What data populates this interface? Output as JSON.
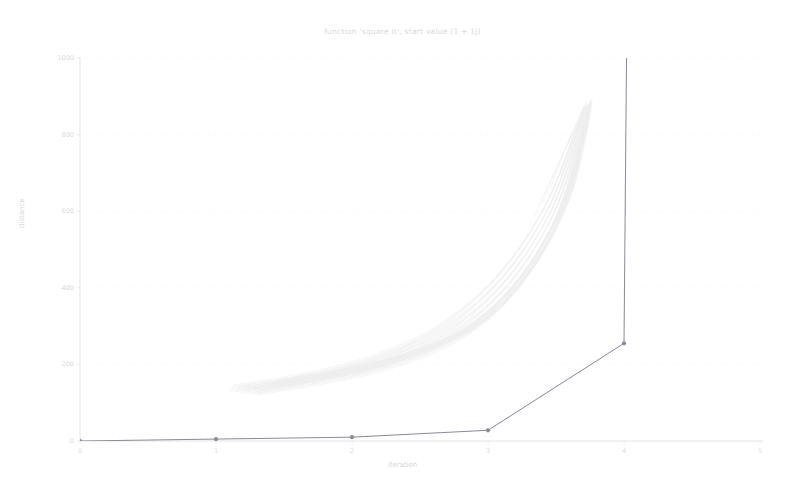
{
  "chart_data": {
    "type": "line",
    "title": "function 'square it', start value (1 + 1j)",
    "xlabel": "iteration",
    "ylabel": "distance",
    "xlim": [
      0,
      5
    ],
    "ylim": [
      0,
      1000
    ],
    "grid": true,
    "grid_style": "dotted",
    "legend": "none",
    "xticks": [
      0,
      1,
      2,
      3,
      4,
      5
    ],
    "xtick_labels": [
      "0",
      "1",
      "2",
      "3",
      "4",
      "5"
    ],
    "yticks": [
      0,
      200,
      400,
      600,
      800,
      1000
    ],
    "ytick_labels": [
      "0",
      "200",
      "400",
      "600",
      "800",
      "1000"
    ],
    "series": [
      {
        "name": "trajectory",
        "color": "#8a8a99",
        "marker": "circle",
        "linewidth": 1,
        "x": [
          0,
          1,
          2,
          3,
          4,
          4.02
        ],
        "values": [
          0,
          5,
          10,
          28,
          255,
          1060
        ]
      },
      {
        "name": "ensemble",
        "color": "#ededed",
        "marker": "none",
        "linewidth": 0.7,
        "description": "faint bundle of exponential-growth curves",
        "curves": [
          {
            "x": [
              1.1,
              1.6,
              2.1,
              2.6,
              3.05,
              3.4,
              3.62,
              3.7
            ],
            "values": [
              130,
              160,
              205,
              285,
              420,
              600,
              790,
              870
            ]
          },
          {
            "x": [
              1.14,
              1.64,
              2.14,
              2.64,
              3.08,
              3.42,
              3.63,
              3.7
            ],
            "values": [
              128,
              158,
              202,
              281,
              414,
              592,
              783,
              868
            ]
          },
          {
            "x": [
              1.18,
              1.68,
              2.18,
              2.68,
              3.11,
              3.44,
              3.64,
              3.71
            ],
            "values": [
              126,
              156,
              199,
              277,
              408,
              585,
              776,
              866
            ]
          },
          {
            "x": [
              1.22,
              1.72,
              2.22,
              2.72,
              3.14,
              3.46,
              3.65,
              3.71
            ],
            "values": [
              124,
              154,
              196,
              273,
              402,
              578,
              770,
              864
            ]
          },
          {
            "x": [
              1.26,
              1.76,
              2.26,
              2.76,
              3.17,
              3.48,
              3.66,
              3.72
            ],
            "values": [
              122,
              152,
              193,
              269,
              396,
              571,
              764,
              862
            ]
          },
          {
            "x": [
              1.3,
              1.8,
              2.3,
              2.8,
              3.2,
              3.5,
              3.67,
              3.72
            ],
            "values": [
              120,
              150,
              190,
              265,
              390,
              564,
              758,
              860
            ]
          },
          {
            "x": [
              1.34,
              1.84,
              2.34,
              2.84,
              3.23,
              3.52,
              3.68,
              3.73
            ],
            "values": [
              134,
              164,
              208,
              288,
              422,
              598,
              786,
              872
            ]
          },
          {
            "x": [
              1.38,
              1.88,
              2.38,
              2.88,
              3.26,
              3.54,
              3.69,
              3.73
            ],
            "values": [
              138,
              168,
              213,
              294,
              430,
              606,
              792,
              874
            ]
          },
          {
            "x": [
              1.42,
              1.92,
              2.42,
              2.92,
              3.29,
              3.56,
              3.7,
              3.74
            ],
            "values": [
              142,
              172,
              218,
              300,
              437,
              613,
              797,
              876
            ]
          },
          {
            "x": [
              1.46,
              1.96,
              2.46,
              2.96,
              3.32,
              3.58,
              3.71,
              3.74
            ],
            "values": [
              146,
              176,
              223,
              306,
              444,
              620,
              802,
              878
            ]
          }
        ],
        "fan_below": [
          {
            "x": [
              3.7,
              3.6,
              3.52,
              3.46
            ],
            "values": [
              870,
              790,
              720,
              660
            ]
          },
          {
            "x": [
              3.7,
              3.58,
              3.48,
              3.4
            ],
            "values": [
              866,
              770,
              690,
              620
            ]
          },
          {
            "x": [
              3.7,
              3.64,
              3.58,
              3.54
            ],
            "values": [
              862,
              800,
              745,
              700
            ]
          },
          {
            "x": [
              3.7,
              3.56,
              3.44,
              3.34
            ],
            "values": [
              858,
              755,
              665,
              585
            ]
          },
          {
            "x": [
              3.7,
              3.66,
              3.62,
              3.59
            ],
            "values": [
              854,
              810,
              768,
              735
            ]
          }
        ]
      }
    ],
    "annotations": [
      {
        "text": "trajectory diverges above plot limit after iteration 4"
      }
    ]
  }
}
